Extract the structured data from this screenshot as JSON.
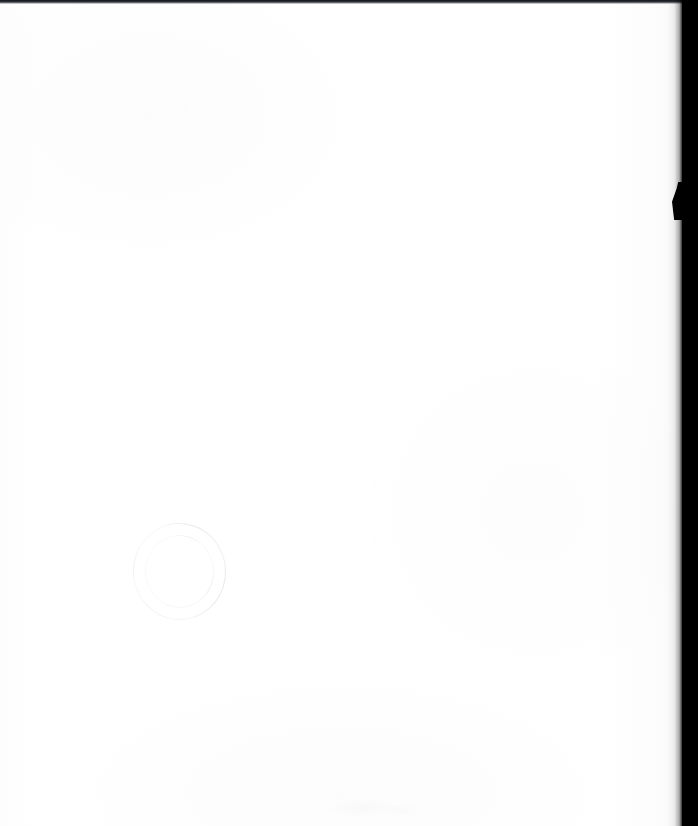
{
  "document": {
    "kind": "scanned-page",
    "page_condition": "blank",
    "page_width": 698,
    "page_height": 826,
    "background_color": "#ffffff",
    "body_text": ""
  },
  "scan_artifacts": {
    "top_edge": {
      "label": "top-scan-line",
      "color": "#14161a"
    },
    "right_edge": {
      "label": "scanner-backing",
      "color": "#000000"
    },
    "edge_notch": {
      "label": "page-edge-notch"
    },
    "bottom_smudge": {
      "label": "faint-smudge"
    }
  },
  "stamp": {
    "shape": "circular",
    "ink_color": "#6f748c",
    "top_arc_text": "",
    "bottom_arc_text": "",
    "center_text": ""
  }
}
